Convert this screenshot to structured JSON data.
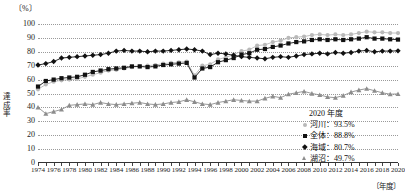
{
  "chart_data": {
    "type": "line",
    "title": "",
    "xlabel": "〔年度〕",
    "ylabel": "達成率",
    "yunit": "〔%〕",
    "ylim": [
      0,
      100
    ],
    "ytick_step": 10,
    "yticks": [
      "0",
      "10",
      "20",
      "30",
      "40",
      "50",
      "60",
      "70",
      "80",
      "90",
      "100"
    ],
    "xlim": [
      1974,
      2020
    ],
    "x": [
      1974,
      1975,
      1976,
      1977,
      1978,
      1979,
      1980,
      1981,
      1982,
      1983,
      1984,
      1985,
      1986,
      1987,
      1988,
      1989,
      1990,
      1991,
      1992,
      1993,
      1994,
      1995,
      1996,
      1997,
      1998,
      1999,
      2000,
      2001,
      2002,
      2003,
      2004,
      2005,
      2006,
      2007,
      2008,
      2009,
      2010,
      2011,
      2012,
      2013,
      2014,
      2015,
      2016,
      2017,
      2018,
      2019,
      2020
    ],
    "xtick_labels": [
      "1974",
      "1976",
      "1978",
      "1980",
      "1982",
      "1984",
      "1986",
      "1988",
      "1990",
      "1992",
      "1994",
      "1996",
      "1998",
      "2000",
      "2002",
      "2004",
      "2006",
      "2008",
      "2010",
      "2012",
      "2014",
      "2016",
      "2018",
      "2020"
    ],
    "grid": true,
    "legend_position": "bottom-right",
    "legend_title": "2020 年度",
    "series": [
      {
        "name": "河川",
        "label": "河川：93.5%",
        "latest_value": 93.5,
        "color": "#b9b9b9",
        "marker": "circle",
        "values": [
          53.0,
          56.5,
          58.5,
          59.5,
          60.0,
          60.5,
          62.0,
          63.5,
          65.0,
          66.5,
          67.0,
          68.0,
          69.0,
          69.5,
          70.0,
          70.5,
          71.5,
          72.0,
          72.5,
          73.0,
          63.0,
          70.0,
          71.0,
          74.5,
          76.0,
          78.0,
          80.5,
          81.5,
          84.5,
          85.0,
          87.0,
          88.0,
          90.0,
          90.5,
          91.0,
          92.0,
          92.5,
          92.0,
          92.5,
          92.0,
          92.5,
          93.5,
          94.5,
          94.0,
          94.0,
          93.5,
          93.5
        ]
      },
      {
        "name": "全体",
        "label": "全体：88.8%",
        "latest_value": 88.8,
        "color": "#111111",
        "marker": "square",
        "values": [
          55.0,
          59.0,
          60.0,
          61.0,
          61.5,
          62.0,
          63.5,
          65.5,
          66.5,
          67.5,
          68.0,
          68.5,
          69.5,
          69.5,
          69.0,
          69.5,
          70.5,
          71.0,
          71.5,
          72.0,
          61.5,
          68.0,
          69.0,
          72.5,
          74.0,
          75.5,
          78.0,
          79.0,
          81.5,
          82.0,
          83.5,
          84.5,
          86.0,
          87.0,
          87.5,
          88.5,
          89.0,
          88.5,
          89.0,
          88.5,
          89.0,
          89.5,
          90.5,
          89.5,
          89.5,
          89.0,
          88.8
        ]
      },
      {
        "name": "海域",
        "label": "海域：80.7%",
        "latest_value": 80.7,
        "color": "#111111",
        "marker": "diamond",
        "values": [
          70.5,
          71.5,
          73.0,
          75.5,
          76.0,
          76.5,
          77.0,
          77.5,
          78.0,
          79.0,
          80.5,
          81.0,
          80.5,
          80.5,
          80.0,
          80.5,
          80.5,
          81.0,
          81.5,
          82.0,
          81.5,
          80.5,
          78.0,
          79.0,
          78.5,
          77.5,
          76.5,
          76.0,
          75.5,
          75.0,
          76.0,
          76.5,
          76.0,
          77.0,
          78.0,
          78.5,
          79.0,
          78.5,
          79.5,
          79.0,
          79.5,
          80.5,
          81.0,
          80.0,
          80.5,
          80.5,
          80.7
        ]
      },
      {
        "name": "湖沼",
        "label": "湖沼：49.7%",
        "latest_value": 49.7,
        "color": "#8d8d8d",
        "marker": "triangle",
        "values": [
          40.0,
          35.5,
          37.0,
          38.5,
          41.5,
          42.0,
          42.5,
          42.0,
          43.5,
          42.5,
          42.0,
          42.5,
          43.0,
          43.5,
          42.5,
          42.0,
          42.5,
          43.5,
          44.0,
          45.5,
          44.0,
          42.5,
          42.0,
          43.5,
          44.5,
          45.5,
          45.0,
          44.5,
          44.5,
          46.5,
          48.0,
          47.0,
          49.5,
          50.5,
          51.5,
          50.0,
          49.0,
          47.5,
          47.0,
          48.5,
          51.0,
          52.5,
          53.5,
          52.0,
          50.5,
          49.5,
          49.7
        ]
      }
    ]
  }
}
